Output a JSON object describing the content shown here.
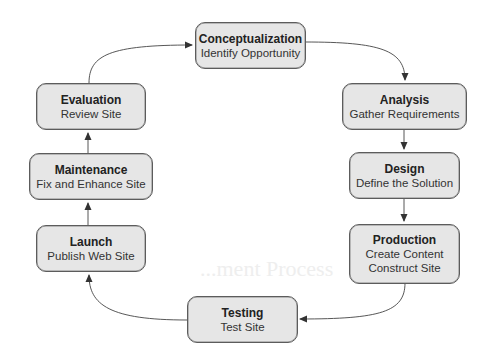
{
  "diagram": {
    "type": "cycle",
    "background_heading_fragment": "...ment Process",
    "colors": {
      "node_fill": "#e6e6e6",
      "node_border": "#5c5c5c",
      "edge": "#333333",
      "text": "#222222"
    },
    "nodes": [
      {
        "id": "conceptualization",
        "title": "Conceptualization",
        "lines": [
          "Identify Opportunity"
        ]
      },
      {
        "id": "analysis",
        "title": "Analysis",
        "lines": [
          "Gather Requirements"
        ]
      },
      {
        "id": "design",
        "title": "Design",
        "lines": [
          "Define the Solution"
        ]
      },
      {
        "id": "production",
        "title": "Production",
        "lines": [
          "Create Content",
          "Construct Site"
        ]
      },
      {
        "id": "testing",
        "title": "Testing",
        "lines": [
          "Test Site"
        ]
      },
      {
        "id": "launch",
        "title": "Launch",
        "lines": [
          "Publish Web Site"
        ]
      },
      {
        "id": "maintenance",
        "title": "Maintenance",
        "lines": [
          "Fix and Enhance Site"
        ]
      },
      {
        "id": "evaluation",
        "title": "Evaluation",
        "lines": [
          "Review Site"
        ]
      }
    ],
    "edges": [
      {
        "from": "conceptualization",
        "to": "analysis"
      },
      {
        "from": "analysis",
        "to": "design"
      },
      {
        "from": "design",
        "to": "production"
      },
      {
        "from": "production",
        "to": "testing"
      },
      {
        "from": "testing",
        "to": "launch"
      },
      {
        "from": "launch",
        "to": "maintenance"
      },
      {
        "from": "maintenance",
        "to": "evaluation"
      },
      {
        "from": "evaluation",
        "to": "conceptualization"
      }
    ]
  }
}
